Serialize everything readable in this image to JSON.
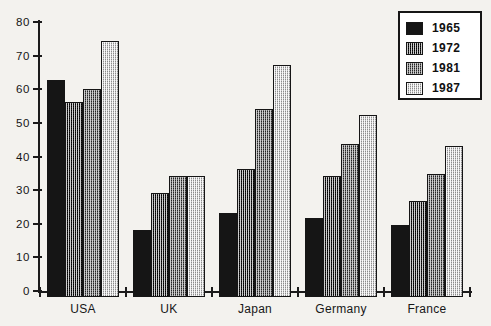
{
  "chart_data": {
    "type": "bar",
    "title": "",
    "xlabel": "",
    "ylabel": "",
    "ylim": [
      0,
      80
    ],
    "yticks": [
      0,
      10,
      20,
      30,
      40,
      50,
      60,
      70,
      80
    ],
    "grid": false,
    "legend_position": "top-right",
    "categories": [
      "USA",
      "UK",
      "Japan",
      "Germany",
      "France"
    ],
    "series": [
      {
        "name": "1965",
        "pattern": "solid-black",
        "color": "#151515",
        "values": [
          64.5,
          20.0,
          25.0,
          23.5,
          21.5
        ]
      },
      {
        "name": "1972",
        "pattern": "dark-checker",
        "color": "#242424",
        "values": [
          58.0,
          31.0,
          38.0,
          36.0,
          28.5
        ]
      },
      {
        "name": "1981",
        "pattern": "mid-checker",
        "color": "#6f6f6f",
        "values": [
          62.0,
          36.0,
          56.0,
          45.5,
          36.5
        ]
      },
      {
        "name": "1987",
        "pattern": "light-checker",
        "color": "#c9c9c9",
        "values": [
          76.0,
          36.0,
          69.0,
          54.0,
          45.0
        ]
      }
    ]
  },
  "axis": {
    "y_tick_labels": [
      "0",
      "10",
      "20",
      "30",
      "40",
      "50",
      "60",
      "70",
      "80"
    ],
    "x_tick_labels": [
      "USA",
      "UK",
      "Japan",
      "Germany",
      "France"
    ]
  },
  "legend": {
    "items": [
      {
        "label": "1965",
        "swatch": "solid-black-swatch"
      },
      {
        "label": "1972",
        "swatch": "dark-checker-swatch"
      },
      {
        "label": "1981",
        "swatch": "mid-checker-swatch"
      },
      {
        "label": "1987",
        "swatch": "light-checker-swatch"
      }
    ]
  },
  "colors": {
    "background": "#f3f2ee",
    "axis": "#1b1b1b",
    "text": "#151515",
    "legend_border": "#161616"
  }
}
